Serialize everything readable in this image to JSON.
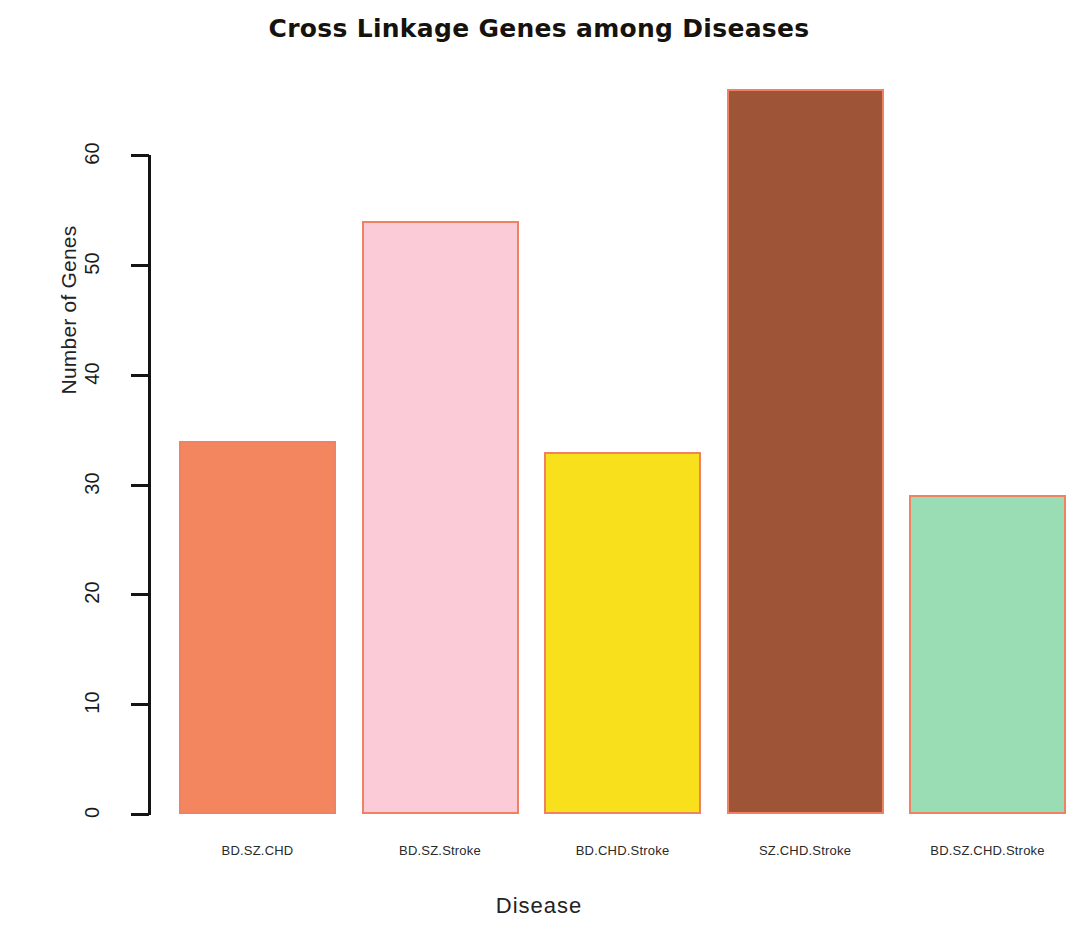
{
  "chart_data": {
    "type": "bar",
    "title": "Cross Linkage Genes among Diseases",
    "xlabel": "Disease",
    "ylabel": "Number of Genes",
    "categories": [
      "BD.SZ.CHD",
      "BD.SZ.Stroke",
      "BD.CHD.Stroke",
      "SZ.CHD.Stroke",
      "BD.SZ.CHD.Stroke"
    ],
    "values": [
      34,
      54,
      33,
      66,
      29
    ],
    "bar_colors": [
      "#F4865F",
      "#FBCBD8",
      "#F8E01C",
      "#9E5436",
      "#9ADDB4"
    ],
    "bar_border_color": "#EF8262",
    "ytick_labels": [
      "0",
      "10",
      "20",
      "30",
      "40",
      "50",
      "60"
    ],
    "ytick_values": [
      0,
      10,
      20,
      30,
      40,
      50,
      60
    ],
    "ylim": [
      0,
      60
    ],
    "grid": false,
    "legend": false,
    "background": "#FFFFFF"
  }
}
